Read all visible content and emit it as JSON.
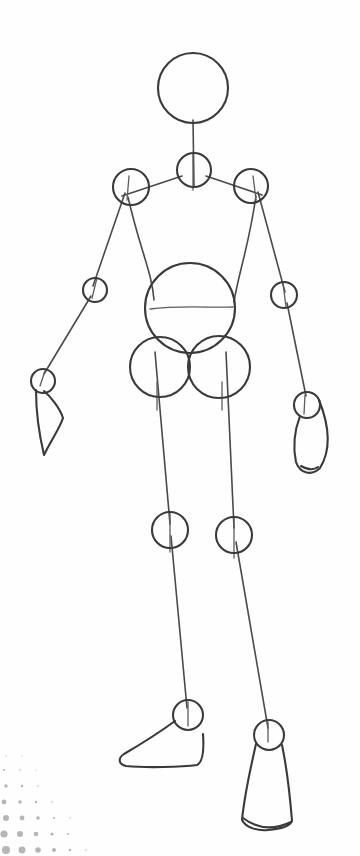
{
  "canvas": {
    "width": 360,
    "height": 856,
    "background_color": "#fefefe",
    "ink_color": "#3a3a3c",
    "accent_color": "#b8b8bc",
    "title": "Mannequin Figure Construction Sketch",
    "medium": "pencil line drawing"
  },
  "figure": {
    "name": "gesture-mannequin",
    "pose": "standing, front view, weight shifted, arms hanging at sides"
  },
  "joints": [
    {
      "id": "head",
      "label": "Head",
      "cx": 193,
      "cy": 88,
      "r": 35
    },
    {
      "id": "neck",
      "label": "Neck",
      "cx": 194,
      "cy": 170,
      "r": 17
    },
    {
      "id": "shoulder-left",
      "label": "Left Shoulder",
      "cx": 131,
      "cy": 187,
      "r": 18
    },
    {
      "id": "shoulder-right",
      "label": "Right Shoulder",
      "cx": 251,
      "cy": 186,
      "r": 17
    },
    {
      "id": "elbow-left",
      "label": "Left Elbow",
      "cx": 95,
      "cy": 290,
      "r": 12
    },
    {
      "id": "elbow-right",
      "label": "Right Elbow",
      "cx": 284,
      "cy": 295,
      "r": 13
    },
    {
      "id": "wrist-left",
      "label": "Left Wrist",
      "cx": 43,
      "cy": 381,
      "r": 12
    },
    {
      "id": "wrist-right",
      "label": "Right Wrist",
      "cx": 307,
      "cy": 405,
      "r": 13
    },
    {
      "id": "ribcage",
      "label": "Ribcage",
      "cx": 190,
      "cy": 308,
      "r": 45
    },
    {
      "id": "hip-left",
      "label": "Left Hip",
      "cx": 160,
      "cy": 367,
      "r": 30
    },
    {
      "id": "hip-right",
      "label": "Right Hip",
      "cx": 219,
      "cy": 367,
      "r": 31
    },
    {
      "id": "knee-left",
      "label": "Left Knee",
      "cx": 170,
      "cy": 530,
      "r": 18
    },
    {
      "id": "knee-right",
      "label": "Right Knee",
      "cx": 234,
      "cy": 535,
      "r": 18
    },
    {
      "id": "ankle-left",
      "label": "Left Ankle",
      "cx": 188,
      "cy": 715,
      "r": 15
    },
    {
      "id": "ankle-right",
      "label": "Right Ankle",
      "cx": 269,
      "cy": 735,
      "r": 15
    }
  ],
  "bones": [
    {
      "id": "spine-neck",
      "label": "Neck Column",
      "d": "M 193 120 L 194 187"
    },
    {
      "id": "clavicle-left",
      "label": "Left Clavicle",
      "d": "M 182 176 L 122 196"
    },
    {
      "id": "clavicle-right",
      "label": "Right Clavicle",
      "d": "M 206 176 L 262 195"
    },
    {
      "id": "upperarm-left",
      "label": "Left Upper Arm",
      "d": "M 125 193 L 93 286"
    },
    {
      "id": "upperarm-right",
      "label": "Right Upper Arm",
      "d": "M 258 192 L 285 292"
    },
    {
      "id": "forearm-left",
      "label": "Left Forearm",
      "d": "M 91 296 L 44 374"
    },
    {
      "id": "forearm-right",
      "label": "Right Forearm",
      "d": "M 287 303 L 306 396"
    },
    {
      "id": "torso-side-left",
      "label": "Left Torso Contour",
      "d": "M 128 197 C 140 250 152 272 154 300"
    },
    {
      "id": "torso-side-right",
      "label": "Right Torso Contour",
      "d": "M 256 196 C 248 250 238 275 234 302"
    },
    {
      "id": "thigh-left",
      "label": "Left Thigh",
      "d": "M 155 352 L 170 524"
    },
    {
      "id": "thigh-right",
      "label": "Right Thigh",
      "d": "M 226 352 L 234 528"
    },
    {
      "id": "shin-left",
      "label": "Left Shin",
      "d": "M 171 536 L 187 708"
    },
    {
      "id": "shin-right",
      "label": "Right Shin",
      "d": "M 236 542 L 268 728"
    },
    {
      "id": "chest-line",
      "label": "Chest Division Line",
      "d": "M 150 309 C 180 305 210 308 233 307"
    },
    {
      "id": "hip-tick-left",
      "label": "Left Hip Centerline",
      "d": "M 157 382 L 157 410"
    },
    {
      "id": "hip-tick-right",
      "label": "Right Hip Centerline",
      "d": "M 222 382 L 222 410"
    },
    {
      "id": "knee-tick-left",
      "label": "Left Knee Centerline",
      "d": "M 170 512 L 170 552"
    },
    {
      "id": "knee-tick-right",
      "label": "Right Knee Centerline",
      "d": "M 234 518 L 234 558"
    },
    {
      "id": "neck-tick",
      "label": "Neck Centerline",
      "d": "M 193 152 L 193 190"
    },
    {
      "id": "shoulder-tick-left",
      "label": "Left Shoulder Tick",
      "d": "M 129 176 L 127 200"
    },
    {
      "id": "shoulder-tick-right",
      "label": "Right Shoulder Tick",
      "d": "M 253 176 L 256 200"
    },
    {
      "id": "elbow-tick-left",
      "label": "Left Elbow Tick",
      "d": "M 97 278 L 92 298"
    },
    {
      "id": "elbow-tick-right",
      "label": "Right Elbow Tick",
      "d": "M 283 283 L 286 307"
    },
    {
      "id": "wrist-tick-left",
      "label": "Left Wrist Tick",
      "d": "M 45 371 L 40 386"
    },
    {
      "id": "wrist-tick-right",
      "label": "Right Wrist Tick",
      "d": "M 305 395 L 304 414"
    },
    {
      "id": "ankle-tick-left",
      "label": "Left Ankle Tick",
      "d": "M 188 702 L 188 726"
    },
    {
      "id": "ankle-tick-right",
      "label": "Right Ankle Tick",
      "d": "M 268 722 L 268 742"
    }
  ],
  "extremities": [
    {
      "id": "hand-left",
      "label": "Left Hand",
      "d": "M 36 390 C 36 412 40 438 44 455 C 50 442 60 428 63 418 C 60 408 50 396 44 391"
    },
    {
      "id": "hand-right",
      "label": "Right Hand",
      "d": "M 300 416 C 294 432 293 448 296 462 C 300 474 312 476 320 468 C 330 452 331 430 319 400"
    },
    {
      "id": "hand-right-crease",
      "label": "Right Hand Crease",
      "d": "M 301 466 C 308 470 314 470 318 467"
    },
    {
      "id": "foot-left",
      "label": "Left Foot",
      "d": "M 175 721 C 160 732 136 747 124 754 C 118 758 118 764 126 766 C 146 768 182 767 197 765 C 203 762 204 748 203 734"
    },
    {
      "id": "foot-right",
      "label": "Right Foot",
      "d": "M 256 744 C 250 770 244 800 242 820 C 246 828 258 831 268 830 C 280 829 290 826 292 821 C 290 796 286 764 282 745"
    },
    {
      "id": "foot-right-crease",
      "label": "Right Foot Crease",
      "d": "M 243 818 C 256 828 272 831 291 822"
    }
  ],
  "decoration": {
    "id": "dot-gradient-corner",
    "label": "Halftone Dot Gradient",
    "position": "bottom-left",
    "color": "#b5b5ba",
    "dots": [
      {
        "cx": 6,
        "cy": 104,
        "r": 4.0
      },
      {
        "cx": 22,
        "cy": 104,
        "r": 3.4
      },
      {
        "cx": 38,
        "cy": 104,
        "r": 2.8
      },
      {
        "cx": 54,
        "cy": 104,
        "r": 2.0
      },
      {
        "cx": 70,
        "cy": 104,
        "r": 1.3
      },
      {
        "cx": 86,
        "cy": 104,
        "r": 0.8
      },
      {
        "cx": 4,
        "cy": 88,
        "r": 3.6
      },
      {
        "cx": 20,
        "cy": 88,
        "r": 3.0
      },
      {
        "cx": 36,
        "cy": 88,
        "r": 2.3
      },
      {
        "cx": 52,
        "cy": 88,
        "r": 1.6
      },
      {
        "cx": 68,
        "cy": 88,
        "r": 1.0
      },
      {
        "cx": 6,
        "cy": 72,
        "r": 3.0
      },
      {
        "cx": 22,
        "cy": 72,
        "r": 2.4
      },
      {
        "cx": 38,
        "cy": 72,
        "r": 1.8
      },
      {
        "cx": 54,
        "cy": 72,
        "r": 1.1
      },
      {
        "cx": 70,
        "cy": 72,
        "r": 0.7
      },
      {
        "cx": 4,
        "cy": 56,
        "r": 2.4
      },
      {
        "cx": 20,
        "cy": 56,
        "r": 1.8
      },
      {
        "cx": 36,
        "cy": 56,
        "r": 1.2
      },
      {
        "cx": 52,
        "cy": 56,
        "r": 0.8
      },
      {
        "cx": 6,
        "cy": 40,
        "r": 1.7
      },
      {
        "cx": 22,
        "cy": 40,
        "r": 1.2
      },
      {
        "cx": 38,
        "cy": 40,
        "r": 0.8
      },
      {
        "cx": 4,
        "cy": 24,
        "r": 1.1
      },
      {
        "cx": 20,
        "cy": 24,
        "r": 0.8
      },
      {
        "cx": 36,
        "cy": 24,
        "r": 0.5
      },
      {
        "cx": 6,
        "cy": 10,
        "r": 0.7
      },
      {
        "cx": 22,
        "cy": 10,
        "r": 0.5
      }
    ]
  }
}
